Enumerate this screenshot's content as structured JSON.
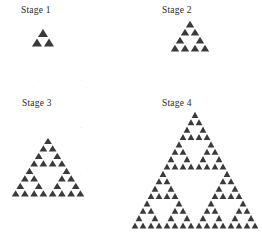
{
  "figure": {
    "background_color": "#ffffff",
    "triangle_color": "#3a3a3a",
    "width": 262,
    "height": 240
  },
  "chart_data": {
    "type": "diagram",
    "title": "",
    "subtitle": "",
    "xlabel": "",
    "ylabel": "",
    "legend": [],
    "grid": false,
    "categories": [
      "Stage 1",
      "Stage 2",
      "Stage 3",
      "Stage 4"
    ],
    "values": [
      3,
      9,
      27,
      81
    ],
    "series": [
      {
        "name": "Number of shaded small triangles",
        "values": [
          3,
          9,
          27,
          81
        ]
      },
      {
        "name": "Recursion depth",
        "values": [
          1,
          2,
          3,
          4
        ]
      },
      {
        "name": "Small triangles along bottom edge",
        "values": [
          2,
          4,
          8,
          16
        ]
      }
    ],
    "stages": [
      {
        "label": "Stage 1",
        "depth": 1,
        "triangle_count": 3,
        "base_units": 2,
        "label_x": 21,
        "label_y": 6,
        "figure_x": 31,
        "figure_y": 28,
        "figure_w": 24,
        "figure_h": 19
      },
      {
        "label": "Stage 2",
        "depth": 2,
        "triangle_count": 9,
        "base_units": 4,
        "label_x": 162,
        "label_y": 6,
        "figure_x": 170,
        "figure_y": 20,
        "figure_w": 40,
        "figure_h": 32
      },
      {
        "label": "Stage 3",
        "depth": 3,
        "triangle_count": 27,
        "base_units": 8,
        "label_x": 22,
        "label_y": 99,
        "figure_x": 11,
        "figure_y": 137,
        "figure_w": 74,
        "figure_h": 60
      },
      {
        "label": "Stage 4",
        "depth": 4,
        "triangle_count": 81,
        "base_units": 16,
        "label_x": 162,
        "label_y": 99,
        "figure_x": 131,
        "figure_y": 111,
        "figure_w": 128,
        "figure_h": 118
      }
    ]
  }
}
